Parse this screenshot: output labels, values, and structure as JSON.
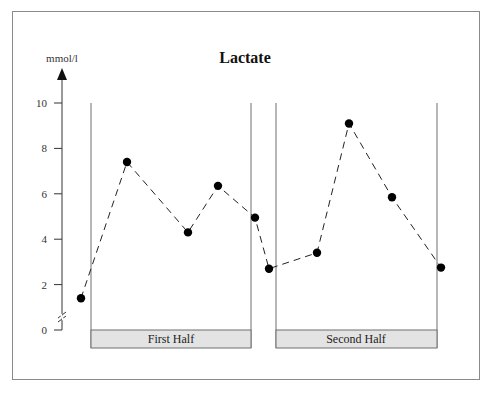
{
  "chart_data": {
    "type": "line",
    "title": "Lactate",
    "ylabel": "mmol/l",
    "xlabel": "",
    "ylim": [
      0,
      10
    ],
    "yticks": [
      0,
      2,
      4,
      6,
      8,
      10
    ],
    "y_axis_break": true,
    "grid": false,
    "legend": null,
    "line_style": "dashed",
    "marker": "filled-circle",
    "panels": [
      {
        "label": "First Half"
      },
      {
        "label": "Second Half"
      }
    ],
    "series": [
      {
        "name": "Lactate",
        "points": [
          {
            "phase": "pre-game",
            "value": 1.4
          },
          {
            "phase": "First Half",
            "value": 7.4
          },
          {
            "phase": "First Half",
            "value": 4.3
          },
          {
            "phase": "First Half",
            "value": 6.35
          },
          {
            "phase": "First Half end",
            "value": 4.95
          },
          {
            "phase": "half-time",
            "value": 2.7
          },
          {
            "phase": "Second Half",
            "value": 3.4
          },
          {
            "phase": "Second Half",
            "value": 9.1
          },
          {
            "phase": "Second Half",
            "value": 5.85
          },
          {
            "phase": "Second Half end",
            "value": 2.75
          }
        ],
        "values": [
          1.4,
          7.4,
          4.3,
          6.35,
          4.95,
          2.7,
          3.4,
          9.1,
          5.85,
          2.75
        ]
      }
    ]
  },
  "labels": {
    "title": "Lactate",
    "unit": "mmol/l",
    "ticks": [
      "0",
      "2",
      "4",
      "6",
      "8",
      "10"
    ],
    "panel_first": "First Half",
    "panel_second": "Second Half"
  },
  "colors": {
    "frame": "#8a8a8a",
    "panel_line": "#6f6f6f",
    "panel_bar_fill": "#e3e3e3",
    "data": "#000000",
    "axis": "#333333"
  }
}
